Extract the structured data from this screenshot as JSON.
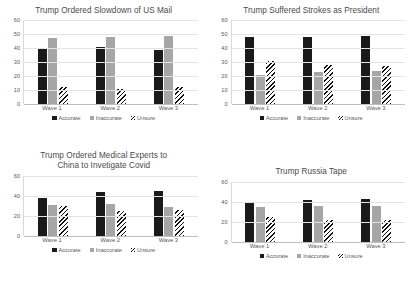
{
  "legend": {
    "entries": [
      {
        "label": "Accurate",
        "color": "#1a1a1a",
        "pattern": "solid"
      },
      {
        "label": "Inaccurate",
        "color": "#a6a6a6",
        "pattern": "solid"
      },
      {
        "label": "Unsure",
        "color": "#ffffff",
        "pattern": "diagonal-hatch"
      }
    ]
  },
  "chart_data": [
    {
      "type": "bar",
      "title": "Trump Ordered Slowdown of US Mail",
      "xlabel": "",
      "ylabel": "",
      "categories": [
        "Wave 1",
        "Wave 2",
        "Wave 3"
      ],
      "yticks": [
        0,
        10,
        20,
        30,
        40,
        50,
        60
      ],
      "ylim": [
        0,
        60
      ],
      "grid": true,
      "legend_position": "bottom",
      "series": [
        {
          "name": "Accurate",
          "values": [
            40,
            41,
            39
          ]
        },
        {
          "name": "Inaccurate",
          "values": [
            47,
            48,
            49
          ]
        },
        {
          "name": "Unsure",
          "values": [
            12,
            11,
            12
          ]
        }
      ]
    },
    {
      "type": "bar",
      "title": "Trump Suffered Strokes as President",
      "xlabel": "",
      "ylabel": "",
      "categories": [
        "Wave 1",
        "Wave 2",
        "Wave 3"
      ],
      "yticks": [
        0,
        10,
        20,
        30,
        40,
        50,
        60
      ],
      "ylim": [
        0,
        60
      ],
      "grid": true,
      "legend_position": "bottom",
      "series": [
        {
          "name": "Accurate",
          "values": [
            48,
            48,
            49
          ]
        },
        {
          "name": "Inaccurate",
          "values": [
            21,
            23,
            24
          ]
        },
        {
          "name": "Unsure",
          "values": [
            31,
            28,
            27
          ]
        }
      ]
    },
    {
      "type": "bar",
      "title": "Trump Ordered Medical Experts to China to Invetigate Covid",
      "title_lines": [
        "Trump Ordered Medical Experts to",
        "China to Invetigate Covid"
      ],
      "xlabel": "",
      "ylabel": "",
      "categories": [
        "Wave 1",
        "Wave 2",
        "Wave 3"
      ],
      "yticks": [
        0,
        20,
        40,
        60
      ],
      "ylim": [
        0,
        60
      ],
      "grid": true,
      "legend_position": "bottom",
      "series": [
        {
          "name": "Accurate",
          "values": [
            38,
            44,
            45
          ]
        },
        {
          "name": "Inaccurate",
          "values": [
            31,
            32,
            29
          ]
        },
        {
          "name": "Unsure",
          "values": [
            30,
            25,
            26
          ]
        }
      ]
    },
    {
      "type": "bar",
      "title": "Trump Russia Tape",
      "xlabel": "",
      "ylabel": "",
      "categories": [
        "Wave 1",
        "Wave 2",
        "Wave 3"
      ],
      "yticks": [
        0,
        20,
        40,
        60
      ],
      "ylim": [
        0,
        60
      ],
      "grid": true,
      "legend_position": "bottom",
      "series": [
        {
          "name": "Accurate",
          "values": [
            40,
            42,
            43
          ]
        },
        {
          "name": "Inaccurate",
          "values": [
            35,
            36,
            36
          ]
        },
        {
          "name": "Unsure",
          "values": [
            25,
            22,
            22
          ]
        }
      ]
    }
  ]
}
